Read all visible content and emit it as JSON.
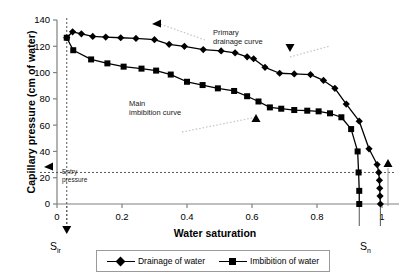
{
  "chart_data": {
    "type": "line",
    "title": "",
    "xlabel": "Water saturation",
    "ylabel": "Capillary pressure (cm of water)",
    "xlim": [
      0,
      1.05
    ],
    "ylim": [
      0,
      140
    ],
    "xticks": [
      0,
      0.2,
      0.4,
      0.6,
      0.8,
      1
    ],
    "xticklabels": [
      "0",
      "0.2",
      "0.4",
      "0.6",
      "0.8",
      "1"
    ],
    "yticks": [
      0,
      20,
      40,
      60,
      80,
      100,
      120,
      140
    ],
    "yticklabels": [
      "0",
      "20",
      "40",
      "60",
      "80",
      "100",
      "120",
      "140"
    ],
    "grid": false,
    "legend_position": "bottom",
    "series": [
      {
        "name": "Drainage of water",
        "marker": "diamond",
        "color": "#000000",
        "points": [
          [
            0.03,
            126.5
          ],
          [
            0.048,
            131.0
          ],
          [
            0.075,
            129.5
          ],
          [
            0.11,
            127.5
          ],
          [
            0.15,
            127.0
          ],
          [
            0.196,
            126.5
          ],
          [
            0.243,
            126.0
          ],
          [
            0.3,
            125.0
          ],
          [
            0.345,
            121.5
          ],
          [
            0.392,
            120.0
          ],
          [
            0.45,
            117.5
          ],
          [
            0.505,
            116.5
          ],
          [
            0.548,
            115.0
          ],
          [
            0.585,
            112.0
          ],
          [
            0.605,
            110.5
          ],
          [
            0.64,
            104.0
          ],
          [
            0.685,
            99.5
          ],
          [
            0.73,
            99.0
          ],
          [
            0.78,
            98.5
          ],
          [
            0.82,
            94.0
          ],
          [
            0.855,
            88.0
          ],
          [
            0.89,
            76.0
          ],
          [
            0.93,
            63.0
          ],
          [
            0.96,
            42.0
          ],
          [
            0.985,
            30.0
          ],
          [
            0.99,
            24.0
          ],
          [
            0.992,
            18.0
          ],
          [
            0.993,
            12.0
          ],
          [
            0.994,
            6.0
          ],
          [
            0.995,
            0.0
          ]
        ]
      },
      {
        "name": "Imbibition of water",
        "marker": "square",
        "color": "#000000",
        "points": [
          [
            0.03,
            126.5
          ],
          [
            0.05,
            117.0
          ],
          [
            0.105,
            110.0
          ],
          [
            0.155,
            107.0
          ],
          [
            0.205,
            104.5
          ],
          [
            0.26,
            103.0
          ],
          [
            0.305,
            101.5
          ],
          [
            0.35,
            98.5
          ],
          [
            0.4,
            93.0
          ],
          [
            0.448,
            90.5
          ],
          [
            0.495,
            88.0
          ],
          [
            0.545,
            86.0
          ],
          [
            0.585,
            82.0
          ],
          [
            0.62,
            78.0
          ],
          [
            0.655,
            73.5
          ],
          [
            0.69,
            72.5
          ],
          [
            0.73,
            71.5
          ],
          [
            0.77,
            71.0
          ],
          [
            0.805,
            70.5
          ],
          [
            0.84,
            69.0
          ],
          [
            0.875,
            66.0
          ],
          [
            0.905,
            57.0
          ],
          [
            0.925,
            40.0
          ],
          [
            0.928,
            24.0
          ],
          [
            0.93,
            10.0
          ],
          [
            0.93,
            0.0
          ]
        ]
      }
    ],
    "annotations": [
      {
        "name": "primary-drainage-curve",
        "text": "Primary\ndrainage curve"
      },
      {
        "name": "main-imbibition-curve",
        "text": "Main\nimbibition curve"
      },
      {
        "name": "entry-pressure",
        "text": "Entry\npressure",
        "value": 24
      },
      {
        "name": "s-ir",
        "text": "Sir",
        "x": 0.03
      },
      {
        "name": "s-n",
        "text": "Sn",
        "x": 0.965
      }
    ],
    "reference_lines": {
      "entry_pressure_y": 24,
      "sir_x": 0.03
    }
  },
  "axis": {
    "y_title": "Capillary pressure (cm of water)",
    "x_title": "Water saturation",
    "y_ticks": [
      "140",
      "120",
      "100",
      "80",
      "60",
      "40",
      "20",
      "0"
    ],
    "x_ticks": [
      "0",
      "0.2",
      "0.4",
      "0.6",
      "0.8",
      "1"
    ]
  },
  "annotations": {
    "primary_line1": "Primary",
    "primary_line2": "drainage curve",
    "main_line1": "Main",
    "main_line2": "imbibition curve",
    "entry_line1": "Entry",
    "entry_line2": "pressure",
    "sir": "S",
    "sir_sub": "ir",
    "sn": "S",
    "sn_sub": "n"
  },
  "legend": {
    "items": [
      {
        "label": "Drainage of water",
        "marker": "diamond"
      },
      {
        "label": "Imbibition of water",
        "marker": "square"
      }
    ]
  }
}
